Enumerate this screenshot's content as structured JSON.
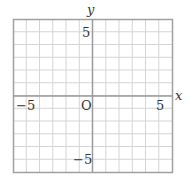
{
  "diagram": {
    "type": "coordinate-grid",
    "x_range": [
      -6,
      6
    ],
    "y_range": [
      -6,
      6
    ],
    "grid_step": 1,
    "axis_labels": {
      "x": "x",
      "y": "y"
    },
    "origin_label": "O",
    "tick_labels": {
      "x_neg": "−5",
      "x_pos": "5",
      "y_pos": "5",
      "y_neg": "−5"
    },
    "colors": {
      "grid": "#cfcfcf",
      "axis": "#9a9a9a",
      "border": "#9a9a9a",
      "text": "#333333"
    }
  }
}
